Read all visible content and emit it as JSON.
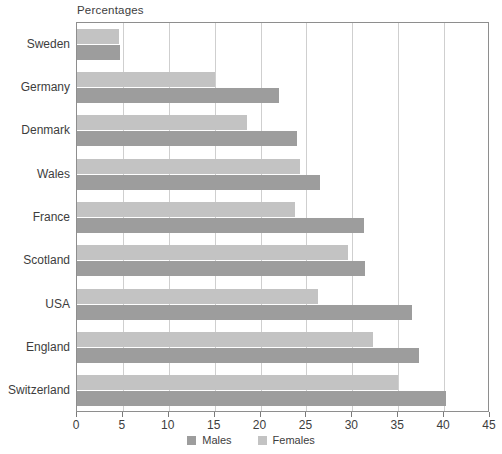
{
  "chart_data": {
    "type": "bar",
    "orientation": "horizontal",
    "title": "Percentages",
    "xlabel": "",
    "ylabel": "",
    "xlim": [
      0,
      45
    ],
    "xticks": [
      0,
      5,
      10,
      15,
      20,
      25,
      30,
      35,
      40,
      45
    ],
    "grid": true,
    "legend_position": "bottom",
    "categories": [
      "Sweden",
      "Germany",
      "Denmark",
      "Wales",
      "France",
      "Scotland",
      "USA",
      "England",
      "Switzerland"
    ],
    "series": [
      {
        "name": "Males",
        "color": "#9d9d9d",
        "values": [
          4.7,
          22.0,
          24.0,
          26.5,
          31.3,
          31.4,
          36.5,
          37.3,
          40.2
        ]
      },
      {
        "name": "Females",
        "color": "#c3c3c3",
        "values": [
          4.6,
          15.0,
          18.5,
          24.3,
          23.8,
          29.5,
          26.3,
          32.3,
          35.0
        ]
      }
    ]
  },
  "legend": {
    "items": [
      {
        "label": "Males",
        "swatch": "males"
      },
      {
        "label": "Females",
        "swatch": "females"
      }
    ]
  },
  "colors": {
    "males": "#9d9d9d",
    "females": "#c3c3c3",
    "grid": "#cfcfcf",
    "frame": "#8e8e8e",
    "text": "#3d3d3d"
  }
}
